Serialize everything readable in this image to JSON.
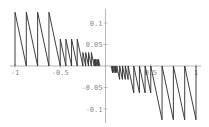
{
  "chart_data": {
    "type": "line",
    "title": "",
    "xlabel": "",
    "ylabel": "",
    "xlim": [
      -1,
      1
    ],
    "ylim": [
      -0.13,
      0.13
    ],
    "grid": false,
    "legend": null,
    "x_ticks": [
      -1,
      -0.5,
      0.5,
      1
    ],
    "x_tick_labels": [
      "-1",
      "-0.5",
      "0.5",
      "1"
    ],
    "y_ticks": [
      0.1,
      0.05,
      -0.05,
      -0.1
    ],
    "y_tick_labels": [
      "0.1",
      "0.05",
      "-0.05",
      "-0.1"
    ],
    "series": [
      {
        "name": "f(x)",
        "levels": [
          {
            "interval": [
              0.5,
              1
            ],
            "teeth": 4,
            "amplitude": 0.125
          },
          {
            "interval": [
              0.25,
              0.5
            ],
            "teeth": 4,
            "amplitude": 0.0625
          },
          {
            "interval": [
              0.125,
              0.25
            ],
            "teeth": 4,
            "amplitude": 0.03125
          },
          {
            "interval": [
              0.0625,
              0.125
            ],
            "teeth": 4,
            "amplitude": 0.015625
          }
        ]
      }
    ]
  },
  "colors": {
    "line": "#2a2a2a",
    "axis": "#9a9a9a",
    "label": "#8a8a8a",
    "background": "#ffffff"
  }
}
